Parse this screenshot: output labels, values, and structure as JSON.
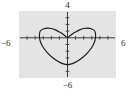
{
  "figure": {
    "name": "graphing-calculator-viewport",
    "background_color": "#e4e4e4",
    "border_color": "#4a4a4a",
    "curve_color": "#1a1a1a",
    "axis_color": "#3a3a3a"
  },
  "labels": {
    "ymax": "4",
    "ymin": "−6",
    "xmin": "−6",
    "xmax": "6"
  },
  "chart_data": {
    "type": "line",
    "title": "",
    "xlabel": "",
    "ylabel": "",
    "xlim": [
      -6,
      6
    ],
    "ylim": [
      -6,
      4
    ],
    "grid": false,
    "legend": null,
    "tick_labels": {
      "x": [
        "−6",
        "6"
      ],
      "y": [
        "4",
        "−6"
      ]
    },
    "axes": {
      "x_axis_at_y": 0,
      "y_axis_at_x": 0,
      "tick_spacing_x": 1,
      "tick_spacing_y": 1,
      "ticks_drawn": true
    },
    "series": [
      {
        "name": "cardioid",
        "equation": "r = 2(1 - sin(theta))",
        "shape": "cardioid with downward cusp at top",
        "cusp_point": [
          0,
          0
        ],
        "extent_x": [
          -3.46,
          3.46
        ],
        "extent_y": [
          -4.0,
          0.0
        ],
        "points": [
          [
            0,
            0
          ],
          [
            -0.52,
            0.5
          ],
          [
            -1.0,
            0.86
          ],
          [
            -1.5,
            1.18
          ],
          [
            -2.0,
            1.38
          ],
          [
            -2.5,
            1.44
          ],
          [
            -3.0,
            1.32
          ],
          [
            -3.35,
            1.05
          ],
          [
            -3.46,
            0.6
          ],
          [
            -3.46,
            0.0
          ],
          [
            -3.3,
            -0.75
          ],
          [
            -3.0,
            -1.45
          ],
          [
            -2.5,
            -2.2
          ],
          [
            -1.9,
            -2.9
          ],
          [
            -1.2,
            -3.5
          ],
          [
            -0.6,
            -3.85
          ],
          [
            0,
            -4.0
          ],
          [
            0.6,
            -3.85
          ],
          [
            1.2,
            -3.5
          ],
          [
            1.9,
            -2.9
          ],
          [
            2.5,
            -2.2
          ],
          [
            3.0,
            -1.45
          ],
          [
            3.3,
            -0.75
          ],
          [
            3.46,
            0.0
          ],
          [
            3.46,
            0.6
          ],
          [
            3.35,
            1.05
          ],
          [
            3.0,
            1.32
          ],
          [
            2.5,
            1.44
          ],
          [
            2.0,
            1.38
          ],
          [
            1.5,
            1.18
          ],
          [
            1.0,
            0.86
          ],
          [
            0.52,
            0.5
          ],
          [
            0,
            0
          ]
        ]
      }
    ]
  }
}
